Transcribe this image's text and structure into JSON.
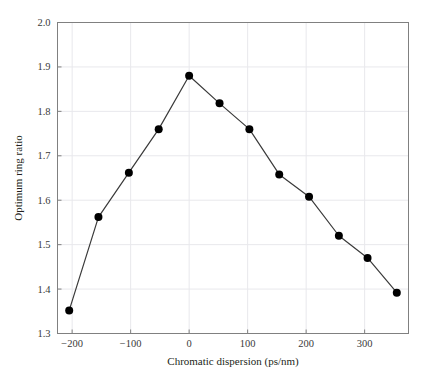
{
  "figure": {
    "background_color": "#ffffff",
    "plot_border_color": "#808080",
    "grid_color": "#e8e8ec",
    "line_color": "#3a3a3a",
    "marker_color": "#000000"
  },
  "chart_data": {
    "type": "line",
    "title": "",
    "xlabel": "Chromatic dispersion (ps/nm)",
    "ylabel": "Optimum ring ratio",
    "xlim": [
      -225,
      375
    ],
    "ylim": [
      1.3,
      2.0
    ],
    "xticks": [
      -200,
      -100,
      0,
      100,
      200,
      300
    ],
    "xtick_labels": [
      "−200",
      "−100",
      "0",
      "100",
      "200",
      "300"
    ],
    "yticks": [
      1.3,
      1.4,
      1.5,
      1.6,
      1.7,
      1.8,
      1.9,
      2.0
    ],
    "ytick_labels": [
      "1.3",
      "1.4",
      "1.5",
      "1.6",
      "1.7",
      "1.8",
      "1.9",
      "2.0"
    ],
    "grid": true,
    "legend": null,
    "marker": "circle",
    "x": [
      -205,
      -155,
      -103,
      -52,
      0,
      52,
      103,
      154,
      205,
      256,
      305,
      355
    ],
    "values": [
      1.352,
      1.562,
      1.662,
      1.76,
      1.88,
      1.818,
      1.76,
      1.658,
      1.608,
      1.52,
      1.47,
      1.392
    ],
    "points": [
      {
        "x": -205,
        "y": 1.352
      },
      {
        "x": -155,
        "y": 1.562
      },
      {
        "x": -103,
        "y": 1.662
      },
      {
        "x": -52,
        "y": 1.76
      },
      {
        "x": 0,
        "y": 1.88
      },
      {
        "x": 52,
        "y": 1.818
      },
      {
        "x": 103,
        "y": 1.76
      },
      {
        "x": 154,
        "y": 1.658
      },
      {
        "x": 205,
        "y": 1.608
      },
      {
        "x": 256,
        "y": 1.52
      },
      {
        "x": 305,
        "y": 1.47
      },
      {
        "x": 355,
        "y": 1.392
      }
    ]
  }
}
